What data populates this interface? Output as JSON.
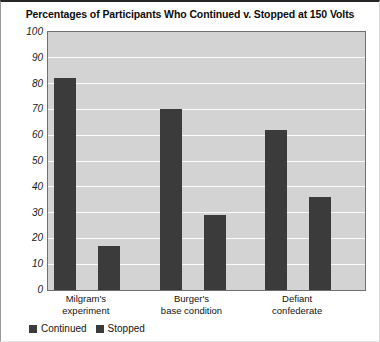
{
  "chart_data": {
    "type": "bar",
    "title": "Percentages of Participants Who Continued v. Stopped at 150 Volts",
    "xlabel": "",
    "ylabel": "",
    "ylim": [
      0,
      100
    ],
    "ytick_step": 10,
    "yticks": [
      100,
      90,
      80,
      70,
      60,
      50,
      40,
      30,
      20,
      10,
      0
    ],
    "ytick_labels": [
      "100",
      "90",
      "80",
      "70",
      "60",
      "50",
      "40",
      "30",
      "20",
      "10",
      "0"
    ],
    "grid": "horizontal",
    "legend_position": "bottom-left",
    "categories": [
      "Milgram's experiment",
      "Burger's base condition",
      "Defiant confederate"
    ],
    "category_lines": [
      [
        "Milgram's",
        "experiment"
      ],
      [
        "Burger's",
        "base condition"
      ],
      [
        "Defiant",
        "confederate"
      ]
    ],
    "series": [
      {
        "name": "Continued",
        "color": "#3b3b3b",
        "values": [
          82,
          70,
          62
        ]
      },
      {
        "name": "Stopped",
        "color": "#3b3b3b",
        "values": [
          17,
          29,
          36
        ]
      }
    ]
  },
  "colors": {
    "bar": "#3b3b3b",
    "plot_background": "#d3d3d3",
    "gridline": "#fbfbfb",
    "plot_border": "#6f6f6f",
    "page_background": "#ffffff",
    "text": "#141414"
  },
  "legend": {
    "items": [
      {
        "label": "Continued",
        "swatch_color": "#3b3b3b"
      },
      {
        "label": "Stopped",
        "swatch_color": "#3b3b3b"
      }
    ]
  }
}
